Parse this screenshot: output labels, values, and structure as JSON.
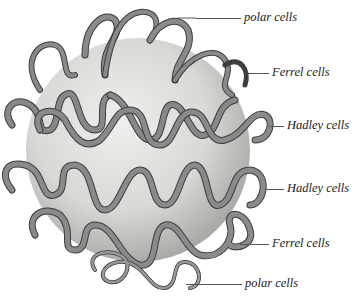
{
  "diagram": {
    "labels": [
      {
        "text": "polar cells",
        "x": 244,
        "y": 11,
        "line_x1": 196,
        "line_x2": 241,
        "line_y": 18
      },
      {
        "text": "Ferrel cells",
        "x": 272,
        "y": 66,
        "line_x1": 247,
        "line_x2": 269,
        "line_y": 73
      },
      {
        "text": "Hadley cells",
        "x": 287,
        "y": 119,
        "line_x1": 270,
        "line_x2": 284,
        "line_y": 126
      },
      {
        "text": "Hadley cells",
        "x": 287,
        "y": 182,
        "line_x1": 265,
        "line_x2": 284,
        "line_y": 189
      },
      {
        "text": "Ferrel cells",
        "x": 272,
        "y": 237,
        "line_x1": 240,
        "line_x2": 269,
        "line_y": 244
      },
      {
        "text": "polar cells",
        "x": 245,
        "y": 277,
        "line_x1": 186,
        "line_x2": 242,
        "line_y": 284
      }
    ],
    "colors": {
      "globe_light": "#e6e6e4",
      "globe_dark": "#a9a9a7",
      "ribbon": "#7a7a7a",
      "ribbon_edge": "#3d3d3d",
      "label_text": "#222222"
    }
  }
}
